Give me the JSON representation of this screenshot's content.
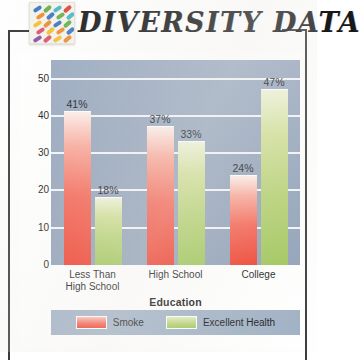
{
  "header": {
    "title": "DIVERSITY DATA",
    "logo_name": "diversity-mosaic-logo",
    "logo_colors": [
      "#3f78c4",
      "#e0453c",
      "#f2c131",
      "#66b24c",
      "#8c53a8",
      "#ee8d36",
      "#4cb8c4",
      "#d9566f"
    ]
  },
  "chart_data": {
    "type": "bar",
    "title": "DIVERSITY DATA",
    "xlabel": "Education",
    "ylabel": "Reported Excellent Health/Smoking",
    "categories": [
      "Less Than High School",
      "High School",
      "College"
    ],
    "category_lines": [
      [
        "Less Than",
        "High School"
      ],
      [
        "High School"
      ],
      [
        "College"
      ]
    ],
    "series": [
      {
        "name": "Smoke",
        "color": "#ef3b29",
        "values": [
          41,
          37,
          24
        ],
        "labels": [
          "41%",
          "37%",
          "24%"
        ]
      },
      {
        "name": "Excellent Health",
        "color": "#9ec558",
        "values": [
          18,
          33,
          47
        ],
        "labels": [
          "18%",
          "33%",
          "47%"
        ]
      }
    ],
    "ylim": [
      0,
      55
    ],
    "yticks": [
      0,
      10,
      20,
      30,
      40,
      50
    ],
    "ytick_labels": [
      "0",
      "10",
      "20",
      "30",
      "40",
      "50"
    ],
    "grid": true,
    "legend_position": "bottom",
    "plot_background": "#94a5bd",
    "gridline_color": "#f3f5f8",
    "legend_background": "#9fb0c4"
  },
  "legend": {
    "entries": [
      {
        "label": "Smoke"
      },
      {
        "label": "Excellent Health"
      }
    ]
  }
}
